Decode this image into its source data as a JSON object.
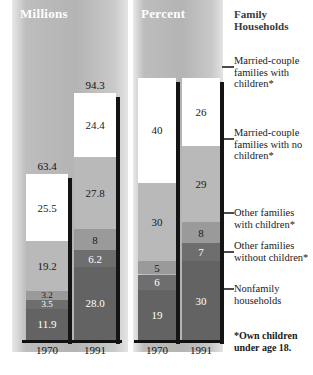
{
  "chart_data": {
    "type": "bar",
    "title": "Family Households",
    "subtype": "stacked-bar",
    "panels": [
      {
        "name": "millions",
        "label": "Millions",
        "unit": "millions",
        "categories": [
          "1970",
          "1991"
        ],
        "totals": [
          "63.4",
          "94.3"
        ],
        "series": [
          {
            "name": "Married-couple families with children*",
            "values": [
              "25.5",
              "24.4"
            ]
          },
          {
            "name": "Married-couple families with no children*",
            "values": [
              "19.2",
              "27.8"
            ]
          },
          {
            "name": "Other families with children*",
            "values": [
              "3.2",
              "8"
            ]
          },
          {
            "name": "Other families without children*",
            "values": [
              "3.5",
              "6.2"
            ]
          },
          {
            "name": "Nonfamily households",
            "values": [
              "11.9",
              "28.0"
            ]
          }
        ]
      },
      {
        "name": "percent",
        "label": "Percent",
        "unit": "percent",
        "categories": [
          "1970",
          "1991"
        ],
        "totals": [
          "",
          ""
        ],
        "series": [
          {
            "name": "Married-couple families with children*",
            "values": [
              "40",
              "26"
            ]
          },
          {
            "name": "Married-couple families with no children*",
            "values": [
              "30",
              "29"
            ]
          },
          {
            "name": "Other families with children*",
            "values": [
              "5",
              "8"
            ]
          },
          {
            "name": "Other families without children*",
            "values": [
              "6",
              "7"
            ]
          },
          {
            "name": "Nonfamily households",
            "values": [
              "19",
              "30"
            ]
          }
        ]
      }
    ],
    "legend_position": "right",
    "grid": false
  },
  "legend": {
    "title_line1": "Family",
    "title_line2": "Households",
    "items": [
      "Married-couple families with children*",
      "Married-couple families with no children*",
      "Other families with children*",
      "Other families without children*",
      "Nonfamily households"
    ],
    "footnote": "*Own children under age 18."
  },
  "colors": {
    "married_with_children": "#ffffff",
    "married_no_children": "#b9b9b9",
    "other_with_children": "#9a9a9a",
    "other_without_children": "#6e6e6e",
    "nonfamily": "#636363",
    "panel_background": "#b4b4b4",
    "shadow": "#141414"
  }
}
